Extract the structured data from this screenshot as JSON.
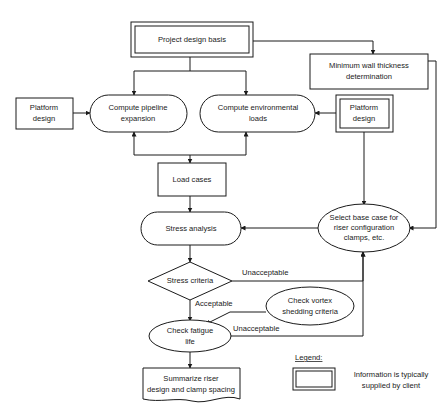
{
  "diagram": {
    "stroke_color": "#1a1a1a",
    "background_color": "#ffffff",
    "nodes": {
      "project_design_basis": "Project design basis",
      "min_wall_thickness_l1": "Minimum wall thickness",
      "min_wall_thickness_l2": "determination",
      "platform_design_left_l1": "Platform",
      "platform_design_left_l2": "design",
      "platform_design_right_l1": "Platform",
      "platform_design_right_l2": "design",
      "compute_pipeline_l1": "Compute pipeline",
      "compute_pipeline_l2": "expansion",
      "compute_env_l1": "Compute environmental",
      "compute_env_l2": "loads",
      "load_cases": "Load cases",
      "stress_analysis": "Stress analysis",
      "select_base_case_l1": "Select base case for",
      "select_base_case_l2": "riser configuration",
      "select_base_case_l3": "clamps, etc.",
      "stress_criteria": "Stress criteria",
      "check_vortex_l1": "Check vortex",
      "check_vortex_l2": "shedding criteria",
      "check_fatigue_l1": "Check fatigue",
      "check_fatigue_l2": "life",
      "summarize_l1": "Summarize riser",
      "summarize_l2": "design and clamp spacing"
    },
    "edge_labels": {
      "stress_unacceptable": "Unacceptable",
      "stress_acceptable": "Acceptable",
      "fatigue_unacceptable": "Unacceptable"
    },
    "legend": {
      "title": "Legend:",
      "description_l1": "Information is typically",
      "description_l2": "supplied by client"
    }
  }
}
